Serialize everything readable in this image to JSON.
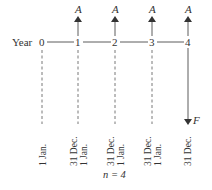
{
  "diagram": {
    "axis_label": "Year",
    "ticks": [
      "0",
      "1",
      "2",
      "3",
      "4"
    ],
    "payment_label": "A",
    "future_value_label": "F",
    "date_labels": [
      {
        "top": "1 Jan."
      },
      {
        "top": "31 Dec.",
        "bottom": "1 Jan."
      },
      {
        "top": "31 Dec.",
        "bottom": "1 Jan."
      },
      {
        "top": "31 Dec.",
        "bottom": "1 Jan."
      },
      {
        "top": "31 Dec."
      }
    ],
    "caption": "n = 4",
    "line_color": "#333333"
  }
}
